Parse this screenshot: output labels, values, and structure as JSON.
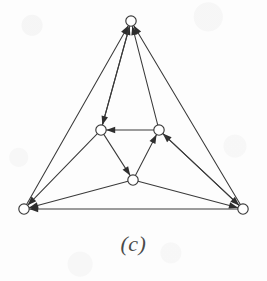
{
  "figure": {
    "caption": "(c)",
    "kind": "directed-graph",
    "width": 267,
    "height": 281,
    "background_color": "#fdfdfd",
    "ink_color": "#3a3a3a",
    "node_fill_color": "#ffffff"
  },
  "chart_data": {
    "type": "diagram",
    "title": "(c)",
    "subtitle": "",
    "xlabel": "",
    "ylabel": "",
    "grid": false,
    "legend": "none",
    "graph_type": "directed",
    "node_radius": 5.2,
    "nodes": [
      {
        "id": "top",
        "label": "",
        "x": 131,
        "y": 21
      },
      {
        "id": "left-mid",
        "label": "",
        "x": 101,
        "y": 130
      },
      {
        "id": "right-mid",
        "label": "",
        "x": 159,
        "y": 130
      },
      {
        "id": "bottom-mid",
        "label": "",
        "x": 133,
        "y": 180
      },
      {
        "id": "bottom-left",
        "label": "",
        "x": 24,
        "y": 209
      },
      {
        "id": "bottom-right",
        "label": "",
        "x": 243,
        "y": 209
      }
    ],
    "edges": [
      {
        "from": "bottom-left",
        "to": "top",
        "arrow": "end"
      },
      {
        "from": "left-mid",
        "to": "top",
        "arrow": "end"
      },
      {
        "from": "right-mid",
        "to": "top",
        "arrow": "end"
      },
      {
        "from": "bottom-right",
        "to": "top",
        "arrow": "end"
      },
      {
        "from": "top",
        "to": "left-mid",
        "arrow": "end"
      },
      {
        "from": "right-mid",
        "to": "left-mid",
        "arrow": "end"
      },
      {
        "from": "left-mid",
        "to": "bottom-mid",
        "arrow": "end"
      },
      {
        "from": "bottom-mid",
        "to": "right-mid",
        "arrow": "end"
      },
      {
        "from": "bottom-right",
        "to": "right-mid",
        "arrow": "end"
      },
      {
        "from": "left-mid",
        "to": "bottom-left",
        "arrow": "end"
      },
      {
        "from": "bottom-mid",
        "to": "bottom-left",
        "arrow": "end"
      },
      {
        "from": "bottom-right",
        "to": "bottom-left",
        "arrow": "end"
      },
      {
        "from": "bottom-mid",
        "to": "bottom-right",
        "arrow": "end"
      },
      {
        "from": "right-mid",
        "to": "bottom-right",
        "arrow": "end"
      }
    ]
  }
}
